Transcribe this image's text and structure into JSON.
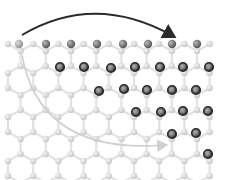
{
  "diagram": {
    "type": "hexagonal-lattice",
    "colors": {
      "background": "#ffffff",
      "bond": "#e2e2e2",
      "light_atom": "#d4d4d4",
      "light_atom_highlight": "#f2f2f2",
      "top_atom": "#7a7a7a",
      "top_atom_first": "#a8a8a8",
      "ring_atom_outer": "#2b2b2b",
      "ring_atom_inner": "#8a8a8a",
      "arrow_dark": "#2a2a2a",
      "arrow_light": "#d0d0d0"
    },
    "lattice": {
      "x0": 8,
      "y0": 44,
      "dx": 12.6,
      "row_dy": 22,
      "rows": 7,
      "cols": 17
    },
    "top_atoms": [
      [
        19,
        44
      ],
      [
        46,
        44
      ],
      [
        71,
        44
      ],
      [
        97,
        44
      ],
      [
        123,
        44
      ],
      [
        148,
        44
      ],
      [
        172,
        44
      ],
      [
        197,
        44
      ]
    ],
    "ring_atoms": [
      [
        60,
        67
      ],
      [
        84,
        67
      ],
      [
        111,
        68
      ],
      [
        135,
        67
      ],
      [
        160,
        67
      ],
      [
        183,
        67
      ],
      [
        209,
        67
      ],
      [
        99,
        91
      ],
      [
        124,
        89
      ],
      [
        147,
        90
      ],
      [
        172,
        90
      ],
      [
        196,
        90
      ],
      [
        136,
        112
      ],
      [
        161,
        112
      ],
      [
        183,
        111
      ],
      [
        208,
        111
      ],
      [
        172,
        134
      ],
      [
        196,
        133
      ],
      [
        208,
        154
      ]
    ],
    "arrows": [
      {
        "name": "top-arrow",
        "path": "M22,35 Q95,-8 173,36",
        "color_key": "arrow_dark",
        "width": 2
      },
      {
        "name": "curved-arrow",
        "path": "M22,55 Q40,155 165,145",
        "color_key": "arrow_light",
        "width": 1.6
      }
    ]
  }
}
